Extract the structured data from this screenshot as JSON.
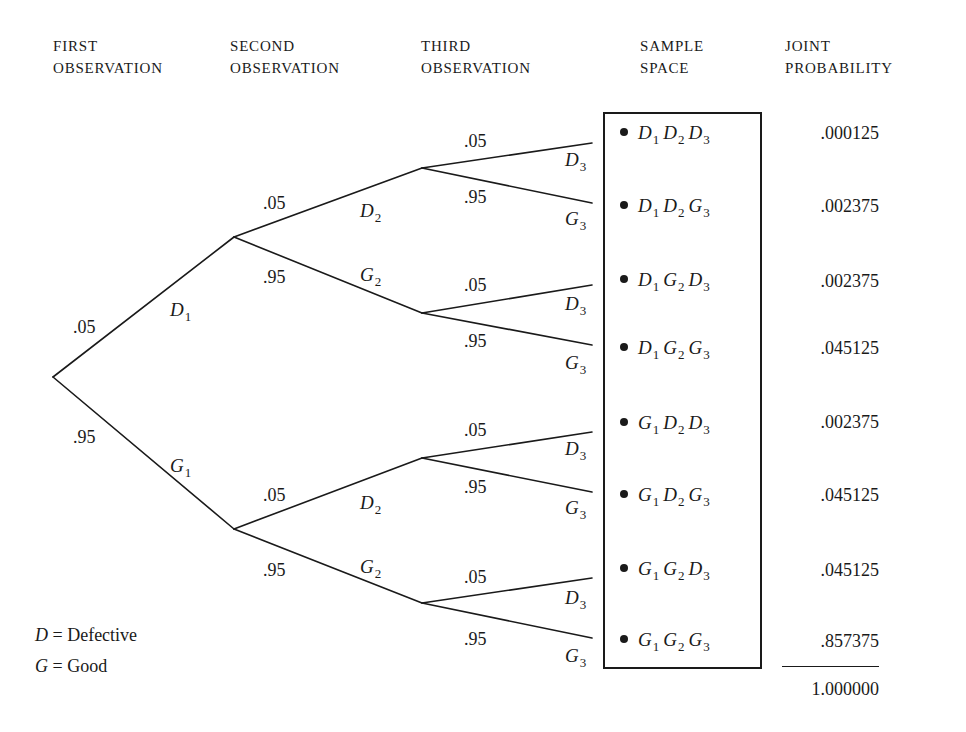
{
  "headers": {
    "first": [
      "FIRST",
      "OBSERVATION"
    ],
    "second": [
      "SECOND",
      "OBSERVATION"
    ],
    "third": [
      "THIRD",
      "OBSERVATION"
    ],
    "sample_space": [
      "SAMPLE",
      "SPACE"
    ],
    "joint_probability": [
      "JOINT",
      "PROBABILITY"
    ]
  },
  "tree": {
    "level1": {
      "upper": {
        "prob": ".05",
        "event": "D",
        "sub": "1"
      },
      "lower": {
        "prob": ".95",
        "event": "G",
        "sub": "1"
      }
    },
    "level2": [
      {
        "upper": {
          "prob": ".05",
          "event": "D",
          "sub": "2"
        },
        "lower": {
          "prob": ".95",
          "event": "G",
          "sub": "2"
        }
      },
      {
        "upper": {
          "prob": ".05",
          "event": "D",
          "sub": "2"
        },
        "lower": {
          "prob": ".95",
          "event": "G",
          "sub": "2"
        }
      }
    ],
    "level3": [
      {
        "upper": {
          "prob": ".05",
          "event": "D",
          "sub": "3"
        },
        "lower": {
          "prob": ".95",
          "event": "G",
          "sub": "3"
        }
      },
      {
        "upper": {
          "prob": ".05",
          "event": "D",
          "sub": "3"
        },
        "lower": {
          "prob": ".95",
          "event": "G",
          "sub": "3"
        }
      },
      {
        "upper": {
          "prob": ".05",
          "event": "D",
          "sub": "3"
        },
        "lower": {
          "prob": ".95",
          "event": "G",
          "sub": "3"
        }
      },
      {
        "upper": {
          "prob": ".05",
          "event": "D",
          "sub": "3"
        },
        "lower": {
          "prob": ".95",
          "event": "G",
          "sub": "3"
        }
      }
    ]
  },
  "outcomes": [
    {
      "e1": "D",
      "e2": "D",
      "e3": "D",
      "p": ".000125"
    },
    {
      "e1": "D",
      "e2": "D",
      "e3": "G",
      "p": ".002375"
    },
    {
      "e1": "D",
      "e2": "G",
      "e3": "D",
      "p": ".002375"
    },
    {
      "e1": "D",
      "e2": "G",
      "e3": "G",
      "p": ".045125"
    },
    {
      "e1": "G",
      "e2": "D",
      "e3": "D",
      "p": ".002375"
    },
    {
      "e1": "G",
      "e2": "D",
      "e3": "G",
      "p": ".045125"
    },
    {
      "e1": "G",
      "e2": "G",
      "e3": "D",
      "p": ".045125"
    },
    {
      "e1": "G",
      "e2": "G",
      "e3": "G",
      "p": ".857375"
    }
  ],
  "subs": {
    "s1": "1",
    "s2": "2",
    "s3": "3"
  },
  "total": "1.000000",
  "legend": {
    "d_symbol": "D",
    "d_text": " = Defective",
    "g_symbol": "G",
    "g_text": " = Good"
  },
  "colors": {
    "ink": "#1a1a1a",
    "background": "#ffffff"
  }
}
